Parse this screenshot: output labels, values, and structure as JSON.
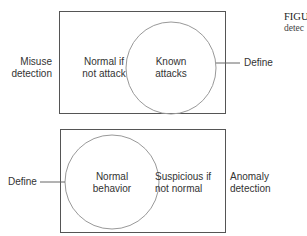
{
  "figure": {
    "caption_title": "FIGU",
    "caption_text": "detec"
  },
  "misuse_panel": {
    "outer_label": "Misuse\ndetection",
    "region_label": "Normal if\nnot attack",
    "ellipse_label": "Known\nattacks",
    "pointer_label": "Define"
  },
  "anomaly_panel": {
    "outer_label": "Anomaly\ndetection",
    "region_label": "Suspicious if\nnot normal",
    "ellipse_label": "Normal\nbehavior",
    "pointer_label": "Define"
  }
}
